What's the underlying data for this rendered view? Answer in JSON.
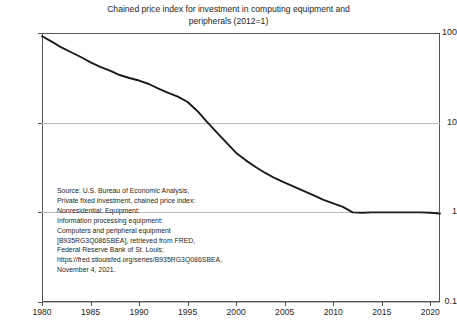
{
  "title": {
    "line1": "Chained price index for investment in computing equipment and",
    "line2": "peripherals (2012=1)"
  },
  "annotation": {
    "lines": [
      "Source: U.S. Bureau of Economic Analysis,",
      "Private fixed investment, chained price index:",
      "Nonresidential: Equipment:",
      "Information processing equipment:",
      "Computers and peripheral equipment",
      "[B935RG3Q086SBEA], retrieved from FRED,",
      "Federal Reserve Bank of St. Louis;",
      "https://fred.stlouisfed.org/series/B935RG3Q086SBEA,",
      "November 4, 2021."
    ]
  },
  "colors": {
    "line": "#1a1a1a",
    "frame": "#555555",
    "grid": "#b9b9b9",
    "text": "#262626",
    "background": "#ffffff"
  },
  "chart_data": {
    "type": "line",
    "title": "Chained price index for investment in computing equipment and peripherals (2012=1)",
    "xlabel": "",
    "ylabel": "",
    "yscale": "log",
    "ylim": [
      0.1,
      100
    ],
    "xlim": [
      1980,
      2021
    ],
    "grid": true,
    "legend": null,
    "ytick_labels": [
      "100",
      "10",
      "1",
      "0.1"
    ],
    "ytick_values": [
      100,
      10,
      1,
      0.1
    ],
    "xtick_labels": [
      "1980",
      "1985",
      "1990",
      "1995",
      "2000",
      "2005",
      "2010",
      "2015",
      "2020"
    ],
    "xtick_values": [
      1980,
      1985,
      1990,
      1995,
      2000,
      2005,
      2010,
      2015,
      2020
    ],
    "series": [
      {
        "name": "Chained price index, computers and peripheral equipment",
        "x": [
          1980,
          1981,
          1982,
          1983,
          1984,
          1985,
          1986,
          1987,
          1988,
          1989,
          1990,
          1991,
          1992,
          1993,
          1994,
          1995,
          1996,
          1997,
          1998,
          1999,
          2000,
          2001,
          2002,
          2003,
          2004,
          2005,
          2006,
          2007,
          2008,
          2009,
          2010,
          2011,
          2012,
          2013,
          2014,
          2015,
          2016,
          2017,
          2018,
          2019,
          2020,
          2021
        ],
        "values": [
          92,
          80,
          69,
          61,
          54,
          47,
          42,
          38,
          34,
          31.5,
          29.5,
          27,
          24,
          21.5,
          19.5,
          17,
          13.5,
          10.2,
          7.8,
          6.0,
          4.6,
          3.8,
          3.2,
          2.75,
          2.4,
          2.15,
          1.92,
          1.72,
          1.55,
          1.38,
          1.26,
          1.15,
          1.0,
          0.99,
          1.0,
          1.0,
          1.0,
          1.0,
          1.0,
          1.0,
          0.99,
          0.97
        ]
      }
    ]
  }
}
